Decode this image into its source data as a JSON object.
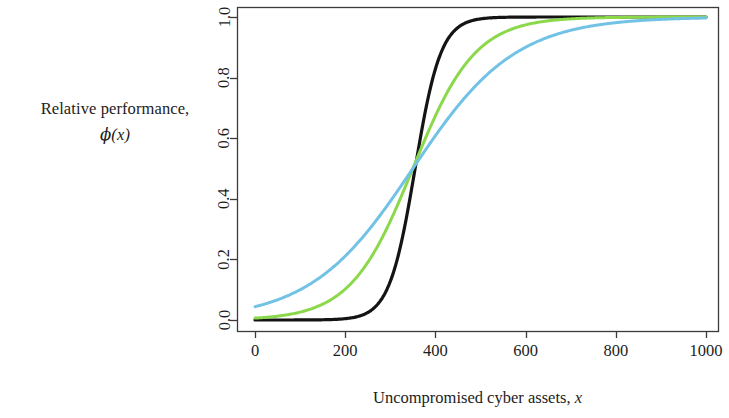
{
  "chart_data": {
    "type": "line",
    "title": "",
    "xlabel": "Uncompromised cyber assets, x",
    "xlabel_text": "Uncompromised cyber assets, ",
    "xlabel_math": "x",
    "ylabel_line1": "Relative performance,",
    "ylabel_line2": "ϕ(x)",
    "ylabel_math_phi": "ϕ",
    "ylabel_math_arg": "(x)",
    "xlim": [
      0,
      1000
    ],
    "ylim": [
      0.0,
      1.0
    ],
    "xticks": [
      0,
      200,
      400,
      600,
      800,
      1000
    ],
    "xtick_labels": [
      "0",
      "200",
      "400",
      "600",
      "800",
      "1000"
    ],
    "yticks": [
      0.0,
      0.2,
      0.4,
      0.6,
      0.8,
      1.0
    ],
    "ytick_labels": [
      "0.0",
      "0.2",
      "0.4",
      "0.6",
      "0.8",
      "1.0"
    ],
    "grid": false,
    "legend": "none",
    "box": true,
    "series": [
      {
        "name": "steep-logistic",
        "color": "#141414",
        "width": 3.2,
        "midpoint": 355,
        "steepness": 0.035,
        "x": [
          0,
          50,
          100,
          150,
          200,
          250,
          275,
          300,
          310,
          320,
          330,
          340,
          350,
          355,
          360,
          370,
          380,
          390,
          400,
          410,
          425,
          450,
          475,
          500,
          550,
          600,
          700,
          800,
          900,
          1000
        ],
        "y": [
          0.0,
          0.0,
          0.0,
          0.001,
          0.004,
          0.025,
          0.058,
          0.129,
          0.172,
          0.224,
          0.287,
          0.358,
          0.436,
          0.478,
          0.522,
          0.607,
          0.685,
          0.754,
          0.811,
          0.857,
          0.908,
          0.958,
          0.982,
          0.993,
          0.999,
          1.0,
          1.0,
          1.0,
          1.0,
          1.0
        ]
      },
      {
        "name": "medium-logistic",
        "color": "#8BD94A",
        "width": 3.0,
        "midpoint": 350,
        "steepness": 0.0145,
        "x": [
          0,
          25,
          50,
          75,
          100,
          125,
          150,
          175,
          200,
          225,
          250,
          275,
          300,
          325,
          350,
          375,
          400,
          425,
          450,
          475,
          500,
          550,
          600,
          650,
          700,
          750,
          800,
          900,
          1000
        ],
        "y": [
          0.006,
          0.009,
          0.013,
          0.018,
          0.026,
          0.037,
          0.052,
          0.073,
          0.102,
          0.14,
          0.189,
          0.25,
          0.322,
          0.402,
          0.487,
          0.571,
          0.65,
          0.721,
          0.78,
          0.829,
          0.868,
          0.924,
          0.957,
          0.976,
          0.986,
          0.992,
          0.995,
          0.999,
          1.0
        ]
      },
      {
        "name": "shallow-logistic",
        "color": "#72C2E6",
        "width": 3.0,
        "midpoint": 350,
        "steepness": 0.0088,
        "x": [
          0,
          25,
          50,
          75,
          100,
          125,
          150,
          175,
          200,
          225,
          250,
          275,
          300,
          325,
          350,
          375,
          400,
          425,
          450,
          475,
          500,
          550,
          600,
          650,
          700,
          750,
          800,
          900,
          1000
        ],
        "y": [
          0.045,
          0.055,
          0.068,
          0.083,
          0.101,
          0.123,
          0.148,
          0.178,
          0.212,
          0.25,
          0.292,
          0.338,
          0.386,
          0.437,
          0.489,
          0.54,
          0.59,
          0.637,
          0.681,
          0.721,
          0.757,
          0.817,
          0.863,
          0.898,
          0.925,
          0.944,
          0.959,
          0.978,
          0.989
        ]
      }
    ]
  },
  "axes": {
    "plot_left_px": 237,
    "plot_right_px": 718,
    "plot_top_px": 7,
    "plot_bottom_px": 331,
    "axis_color": "#3b3b3b",
    "tick_length_px": 7
  }
}
